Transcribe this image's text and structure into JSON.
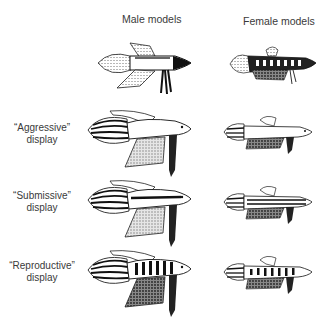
{
  "columns": [
    {
      "label": "Male models"
    },
    {
      "label": "Female models"
    }
  ],
  "rows": [
    {
      "label_line1": "",
      "label_line2": "",
      "male": "male-normal",
      "female": "female-normal"
    },
    {
      "label_line1": "“Aggressive”",
      "label_line2": "display",
      "male": "male-aggressive",
      "female": "female-aggressive"
    },
    {
      "label_line1": "“Submissive”",
      "label_line2": "display",
      "male": "male-submissive",
      "female": "female-submissive"
    },
    {
      "label_line1": "“Reproductive”",
      "label_line2": "display",
      "male": "male-reproductive",
      "female": "female-reproductive"
    }
  ]
}
